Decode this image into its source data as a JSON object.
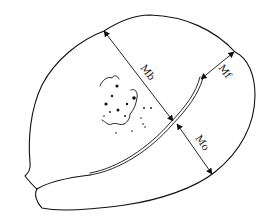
{
  "figure": {
    "colors": {
      "stroke": "#111111",
      "background": "#ffffff"
    },
    "measurements": [
      {
        "id": "mb",
        "label": "Mb",
        "label_rotation": 45
      },
      {
        "id": "mf",
        "label": "Mf",
        "label_rotation": 45
      },
      {
        "id": "mo",
        "label": "Mo",
        "label_rotation": 55
      }
    ]
  }
}
